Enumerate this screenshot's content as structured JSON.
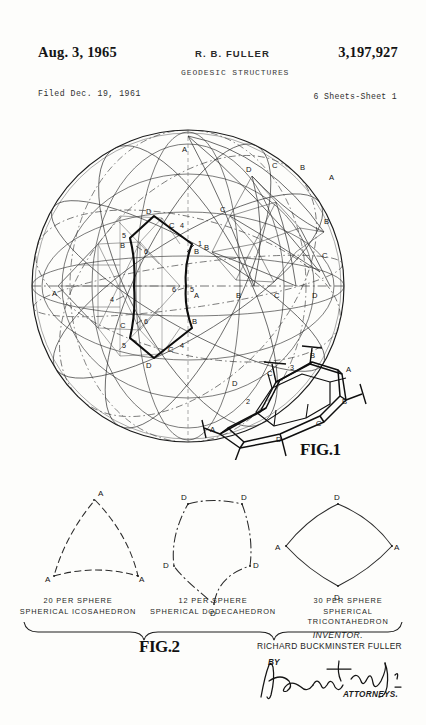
{
  "header": {
    "date": "Aug. 3, 1965",
    "inventor_short": "R. B. FULLER",
    "patent_number": "3,197,927",
    "title": "GEODESIC STRUCTURES",
    "filed": "Filed Dec. 19, 1961",
    "sheets": "6 Sheets-Sheet 1"
  },
  "figures": {
    "fig1": {
      "label": "FIG.1",
      "description": "Spherical geodesic grid with great circles and triangulated subdivision",
      "vertex_labels": [
        "A",
        "B",
        "C",
        "D"
      ],
      "callout_numbers": [
        "1",
        "2",
        "3",
        "4",
        "5",
        "6"
      ]
    },
    "fig2": {
      "label": "FIG.2",
      "panels": [
        {
          "count_line": "20 PER SPHERE",
          "name_line": "SPHERICAL ICOSAHEDRON",
          "shape": "triangle",
          "vertices": [
            "A",
            "A",
            "A"
          ]
        },
        {
          "count_line": "12 PER SPHERE",
          "name_line": "SPHERICAL DODECAHEDRON",
          "shape": "pentagon",
          "vertices": [
            "D",
            "D",
            "D",
            "D",
            "D"
          ]
        },
        {
          "count_line": "30 PER SPHERE",
          "name_line": "SPHERICAL TRICONTAHEDRON",
          "shape": "rhombus",
          "vertices": [
            "D",
            "A",
            "D",
            "A"
          ]
        }
      ]
    }
  },
  "signature": {
    "inventor_label": "INVENTOR.",
    "inventor_name": "RICHARD BUCKMINSTER FULLER",
    "by_label": "BY",
    "attorneys_label": "ATTORNEYS."
  },
  "colors": {
    "ink": "#1a1a1a",
    "light_ink": "#6d6d6d",
    "paper": "#fdfdfb"
  }
}
